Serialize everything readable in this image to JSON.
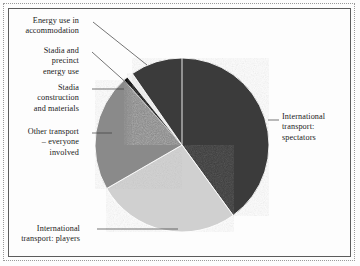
{
  "figure": {
    "background_color": "#fdfdfd",
    "frame_color": "#5c5c5c",
    "dotted_frame_color": "#9a9a9a",
    "text_color": "#1a1a1a"
  },
  "chart_data": {
    "type": "pie",
    "title": "",
    "subtitle": "",
    "xlabel": "",
    "ylabel": "",
    "legend_position": "none",
    "labels_position": "outside-with-leader-lines",
    "grid": false,
    "center": {
      "cx": 182,
      "cy": 145,
      "r": 87
    },
    "start_angle_deg": 0,
    "direction": "clockwise",
    "categories": [
      "International transport: spectators",
      "International transport: players",
      "Other transport – everyone involved",
      "Stadia construction and materials",
      "Stadia and precinct energy use",
      "Energy use in accommodation"
    ],
    "values": [
      40.0,
      26.7,
      21.7,
      0.8,
      1.1,
      9.7
    ],
    "colors": [
      "#3a3a3a",
      "#d0d0d0",
      "#8a8a8a",
      "#101010",
      "#f2f2f2",
      "#3a3a3a"
    ],
    "slices": [
      {
        "name": "International transport: spectators",
        "value": 40.0,
        "color": "#3a3a3a",
        "start_deg": 0,
        "end_deg": 144,
        "label_lines": [
          "International",
          "transport:",
          "spectators"
        ],
        "label_align": "left",
        "label_x": 282,
        "label_y": 112,
        "leader": {
          "x1": 268,
          "y1": 120,
          "x2": 279,
          "y2": 120
        }
      },
      {
        "name": "International transport: players",
        "value": 26.7,
        "color": "#d0d0d0",
        "start_deg": 144,
        "end_deg": 240,
        "label_lines": [
          "International",
          "transport: players"
        ],
        "label_align": "right",
        "label_x": 22,
        "label_y": 224,
        "leader": {
          "x1": 97,
          "y1": 229,
          "x2": 178,
          "y2": 229
        }
      },
      {
        "name": "Other transport – everyone involved",
        "value": 21.7,
        "color": "#8a8a8a",
        "start_deg": 240,
        "end_deg": 318.3,
        "label_lines": [
          "Other transport",
          "– everyone",
          "involved"
        ],
        "label_align": "right",
        "label_x": 21,
        "label_y": 127,
        "leader": {
          "x1": 92,
          "y1": 133,
          "x2": 112,
          "y2": 133
        }
      },
      {
        "name": "Stadia construction and materials",
        "value": 0.8,
        "color": "#101010",
        "start_deg": 318.3,
        "end_deg": 321.2,
        "label_lines": [
          "Stadia",
          "construction",
          "and materials"
        ],
        "label_align": "right",
        "label_x": 21,
        "label_y": 83,
        "leader": {
          "x1": 92,
          "y1": 89,
          "x2": 124,
          "y2": 89
        }
      },
      {
        "name": "Stadia and precinct energy use",
        "value": 1.1,
        "color": "#f2f2f2",
        "start_deg": 321.2,
        "end_deg": 325.2,
        "label_lines": [
          "Stadia and",
          "precinct",
          "energy use"
        ],
        "label_align": "right",
        "label_x": 21,
        "label_y": 46,
        "leader": {
          "x1": 92,
          "y1": 52,
          "x2": 130,
          "y2": 86
        }
      },
      {
        "name": "Energy use in accommodation",
        "value": 9.7,
        "color": "#3a3a3a",
        "start_deg": 325.2,
        "end_deg": 360,
        "label_lines": [
          "Energy use in",
          "accommodation"
        ],
        "label_align": "right",
        "label_x": 21,
        "label_y": 16,
        "leader": {
          "x1": 93,
          "y1": 22,
          "x2": 147,
          "y2": 65
        }
      }
    ]
  }
}
